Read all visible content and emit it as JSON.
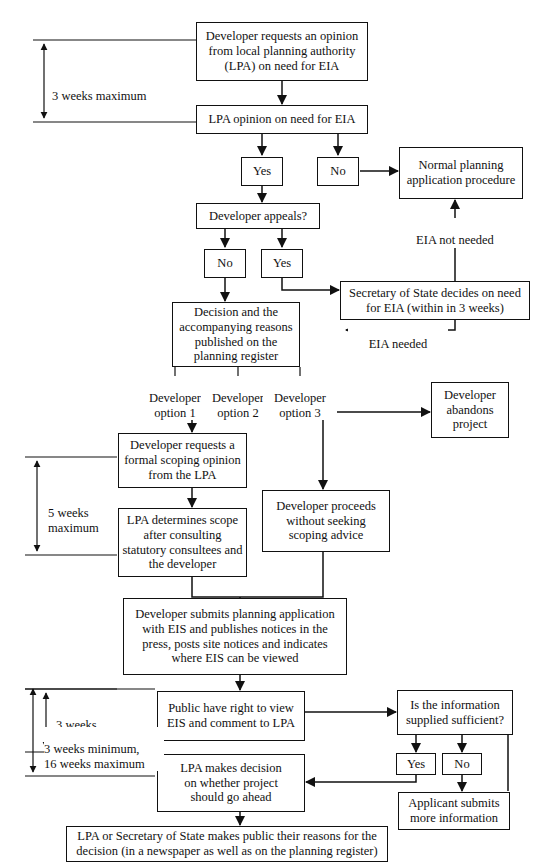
{
  "diagram": {
    "line_color": "#111111",
    "background": "#ffffff"
  },
  "nodes": {
    "developer_requests_opinion": "Developer requests an opinion\nfrom local planning authority\n(LPA) on need for EIA",
    "lpa_opinion": "LPA opinion on need for EIA",
    "yes_1": "Yes",
    "no_1": "No",
    "normal_planning": "Normal planning\napplication procedure",
    "developer_appeals": "Developer appeals?",
    "no_2": "No",
    "yes_2": "Yes",
    "secretary_of_state": "Secretary of State decides on need\nfor EIA (within in 3 weeks)",
    "decision_published": "Decision and the\naccompanying reasons\npublished on the\nplanning register",
    "developer_abandons": "Developer\nabandons\nproject",
    "developer_requests_scoping": "Developer requests a\nformal scoping opinion\nfrom the LPA",
    "lpa_determines_scope": "LPA determines scope\nafter consulting\nstatutory consultees and\nthe developer",
    "developer_proceeds": "Developer proceeds\nwithout seeking\nscoping advice",
    "developer_submits": "Developer submits planning application\nwith EIS and publishes notices in the\npress, posts site notices and indicates\nwhere EIS can be viewed",
    "public_view": "Public have right to view\nEIS and comment to LPA",
    "is_info_sufficient": "Is the information\nsupplied sufficient?",
    "yes_3": "Yes",
    "no_3": "No",
    "applicant_submits": "Applicant submits\nmore information",
    "lpa_makes_decision": "LPA makes decision\non whether project\nshould go ahead",
    "lpa_or_sos_public": "LPA or Secretary of State makes public their reasons for the\ndecision (in a newspaper as well as on the planning register)"
  },
  "edge_labels": {
    "eia_not_needed": "EIA not needed",
    "eia_needed": "EIA needed",
    "developer_option_1": "Developer\noption 1",
    "developer_option_2": "Developer\noption 2",
    "developer_option_3": "Developer\noption 3"
  },
  "timing_brackets": {
    "three_weeks_maximum": "3 weeks maximum",
    "five_weeks_maximum": "5 weeks\nmaximum",
    "three_weeks_minimum": "3 weeks\nminimum",
    "three_min_sixteen_max": "3 weeks minimum,\n16 weeks maximum"
  }
}
